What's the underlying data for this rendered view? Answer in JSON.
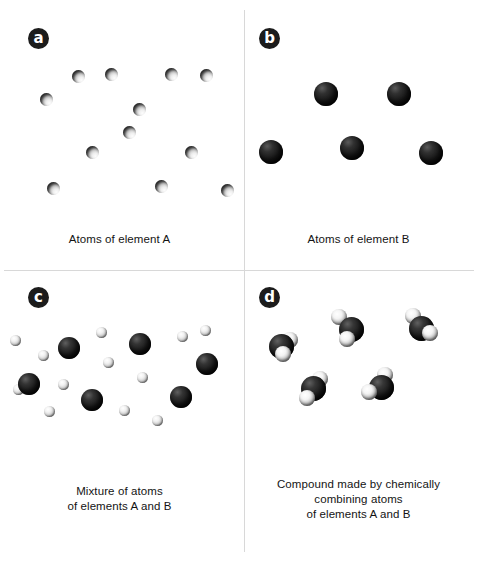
{
  "figure": {
    "width": 478,
    "height": 562,
    "background_color": "#ffffff",
    "divider_color": "#d8d8d8"
  },
  "colors": {
    "badge_background": "#1c1c1c",
    "badge_text": "#ffffff",
    "caption_text": "#141414",
    "element_a_atom": "#c9c9c9",
    "element_b_atom": "#141414"
  },
  "panels": [
    {
      "id": "a",
      "badge_label": "a",
      "caption_lines": [
        "Atoms of element A"
      ],
      "atom_kind": "small-a",
      "atom_count": 12,
      "atoms": [
        {
          "x": 40,
          "y": 93
        },
        {
          "x": 72,
          "y": 70
        },
        {
          "x": 105,
          "y": 68
        },
        {
          "x": 165,
          "y": 68
        },
        {
          "x": 200,
          "y": 69
        },
        {
          "x": 123,
          "y": 126
        },
        {
          "x": 86,
          "y": 146
        },
        {
          "x": 185,
          "y": 146
        },
        {
          "x": 47,
          "y": 182
        },
        {
          "x": 155,
          "y": 180
        },
        {
          "x": 221,
          "y": 184
        },
        {
          "x": 133,
          "y": 103
        }
      ]
    },
    {
      "id": "b",
      "badge_label": "b",
      "caption_lines": [
        "Atoms of element B"
      ],
      "atom_kind": "large-b",
      "atom_count": 5,
      "atoms": [
        {
          "x": 75,
          "y": 82
        },
        {
          "x": 148,
          "y": 82
        },
        {
          "x": 20,
          "y": 140
        },
        {
          "x": 101,
          "y": 136
        },
        {
          "x": 180,
          "y": 141
        }
      ]
    },
    {
      "id": "c",
      "badge_label": "c",
      "caption_lines": [
        "Mixture of atoms",
        "of elements A and B"
      ],
      "atom_kind": "mix",
      "large_count": 6,
      "small_count": 12,
      "large_atoms": [
        {
          "x": 58,
          "y": 56
        },
        {
          "x": 129,
          "y": 52
        },
        {
          "x": 18,
          "y": 92
        },
        {
          "x": 81,
          "y": 108
        },
        {
          "x": 170,
          "y": 105
        },
        {
          "x": 196,
          "y": 72
        }
      ],
      "small_atoms": [
        {
          "x": 10,
          "y": 54
        },
        {
          "x": 38,
          "y": 69
        },
        {
          "x": 96,
          "y": 46
        },
        {
          "x": 177,
          "y": 50
        },
        {
          "x": 103,
          "y": 76
        },
        {
          "x": 58,
          "y": 98
        },
        {
          "x": 137,
          "y": 91
        },
        {
          "x": 44,
          "y": 125
        },
        {
          "x": 119,
          "y": 124
        },
        {
          "x": 152,
          "y": 134
        },
        {
          "x": 200,
          "y": 44
        },
        {
          "x": 13,
          "y": 103
        }
      ]
    },
    {
      "id": "d",
      "badge_label": "d",
      "caption_lines": [
        "Compound made by chemically",
        "combining atoms",
        "of elements A and B"
      ],
      "atom_kind": "molecule",
      "molecule_count": 5,
      "molecules": [
        {
          "x": 22,
          "y": 45,
          "satellites": [
            {
              "x": 21,
              "y": 6
            },
            {
              "x": 14,
              "y": 20
            }
          ]
        },
        {
          "x": 92,
          "y": 28,
          "satellites": [
            {
              "x": 0,
              "y": 0
            },
            {
              "x": 8,
              "y": 22
            }
          ]
        },
        {
          "x": 162,
          "y": 27,
          "satellites": [
            {
              "x": 4,
              "y": 0
            },
            {
              "x": 21,
              "y": 17
            }
          ]
        },
        {
          "x": 54,
          "y": 87,
          "satellites": [
            {
              "x": 19,
              "y": 3
            },
            {
              "x": 6,
              "y": 22
            }
          ]
        },
        {
          "x": 122,
          "y": 86,
          "satellites": [
            {
              "x": 16,
              "y": 0
            },
            {
              "x": 0,
              "y": 17
            }
          ]
        }
      ]
    }
  ]
}
